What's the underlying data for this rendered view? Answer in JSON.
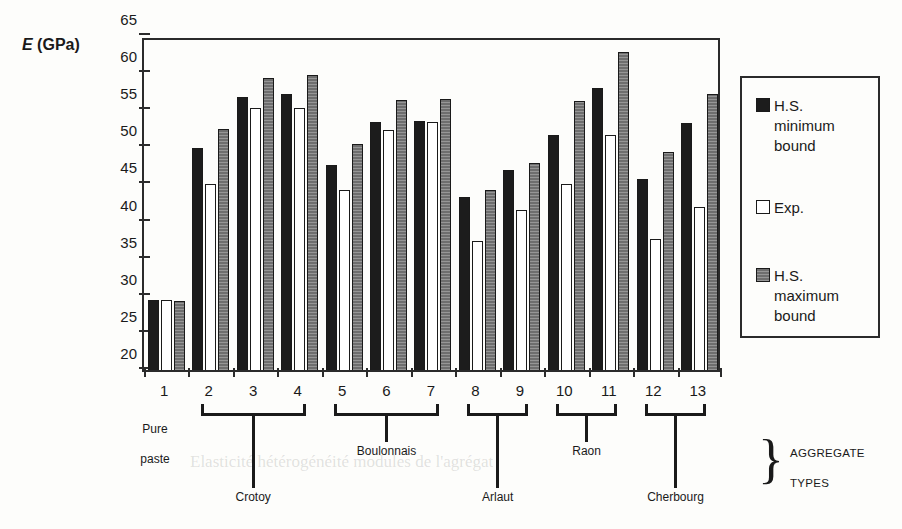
{
  "axis_title": {
    "symbol": "E",
    "unit": " (GPa)"
  },
  "legend": {
    "items": [
      {
        "key": "min",
        "label": "H.S.\nminimum\nbound",
        "swatch": "black-square-icon"
      },
      {
        "key": "exp",
        "label": "Exp.",
        "swatch": "white-square-icon"
      },
      {
        "key": "max",
        "label": "H.S.\nmaximum\nbound",
        "swatch": "gray-square-icon"
      }
    ]
  },
  "aggregate_caption": {
    "brace": "}",
    "line1": "AGGREGATE",
    "line2": "TYPES"
  },
  "pure_paste": {
    "line1": "Pure",
    "line2": "paste"
  },
  "groups": [
    {
      "id": 1,
      "bracket": null
    },
    {
      "id": 2,
      "bracket": "Crotoy"
    },
    {
      "id": 3,
      "bracket": "Crotoy"
    },
    {
      "id": 4,
      "bracket": "Crotoy"
    },
    {
      "id": 5,
      "bracket": "Boulonnais"
    },
    {
      "id": 6,
      "bracket": "Boulonnais"
    },
    {
      "id": 7,
      "bracket": "Boulonnais"
    },
    {
      "id": 8,
      "bracket": "Arlaut"
    },
    {
      "id": 9,
      "bracket": "Arlaut"
    },
    {
      "id": 10,
      "bracket": "Raon"
    },
    {
      "id": 11,
      "bracket": "Raon"
    },
    {
      "id": 12,
      "bracket": "Cherbourg"
    },
    {
      "id": 13,
      "bracket": "Cherbourg"
    }
  ],
  "brackets": [
    {
      "name": "Crotoy",
      "from": 2,
      "to": 4
    },
    {
      "name": "Boulonnais",
      "from": 5,
      "to": 7
    },
    {
      "name": "Arlaut",
      "from": 8,
      "to": 9
    },
    {
      "name": "Raon",
      "from": 10,
      "to": 11
    },
    {
      "name": "Cherbourg",
      "from": 12,
      "to": 13
    }
  ],
  "colors": {
    "min_bound": "#1c1c1c",
    "exp": "#ffffff",
    "max_bound": "#6e6e6e",
    "frame": "#2b2b2b",
    "text": "#1a1a1a"
  },
  "chart_data": {
    "type": "bar",
    "title": "",
    "xlabel": "AGGREGATE TYPES",
    "ylabel": "E (GPa)",
    "ylim": [
      20,
      65
    ],
    "yticks": [
      20,
      25,
      30,
      35,
      40,
      45,
      50,
      55,
      60,
      65
    ],
    "grid": false,
    "legend_position": "right",
    "categories": [
      "1",
      "2",
      "3",
      "4",
      "5",
      "6",
      "7",
      "8",
      "9",
      "10",
      "11",
      "12",
      "13"
    ],
    "category_groups": [
      {
        "label": "Pure paste",
        "categories": [
          "1"
        ]
      },
      {
        "label": "Crotoy",
        "categories": [
          "2",
          "3",
          "4"
        ]
      },
      {
        "label": "Boulonnais",
        "categories": [
          "5",
          "6",
          "7"
        ]
      },
      {
        "label": "Arlaut",
        "categories": [
          "8",
          "9"
        ]
      },
      {
        "label": "Raon",
        "categories": [
          "10",
          "11"
        ]
      },
      {
        "label": "Cherbourg",
        "categories": [
          "12",
          "13"
        ]
      }
    ],
    "series": [
      {
        "name": "H.S. minimum bound",
        "values": [
          29.4,
          49.9,
          56.8,
          57.2,
          47.6,
          53.4,
          53.6,
          43.3,
          46.9,
          51.6,
          58.0,
          45.8,
          53.3
        ]
      },
      {
        "name": "Exp.",
        "values": [
          29.4,
          45.1,
          55.3,
          55.3,
          44.3,
          52.3,
          53.4,
          37.4,
          41.6,
          45.0,
          51.7,
          37.7,
          42.0
        ]
      },
      {
        "name": "H.S. maximum bound",
        "values": [
          29.3,
          52.5,
          59.3,
          59.7,
          50.4,
          56.4,
          56.5,
          44.3,
          47.9,
          56.2,
          62.8,
          49.4,
          57.2
        ]
      }
    ]
  }
}
